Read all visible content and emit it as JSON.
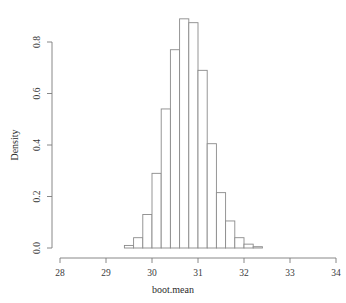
{
  "chart_data": {
    "type": "bar",
    "subtype": "histogram",
    "title": "",
    "xlabel": "boot.mean",
    "ylabel": "Density",
    "xlim": [
      28,
      34
    ],
    "ylim": [
      0,
      0.9
    ],
    "grid": false,
    "legend": null,
    "bin_width": 0.2,
    "bin_edges": [
      29.4,
      29.6,
      29.8,
      30.0,
      30.2,
      30.4,
      30.6,
      30.8,
      31.0,
      31.2,
      31.4,
      31.6,
      31.8,
      32.0,
      32.2,
      32.4
    ],
    "categories": [
      "29.4-29.6",
      "29.6-29.8",
      "29.8-30.0",
      "30.0-30.2",
      "30.2-30.4",
      "30.4-30.6",
      "30.6-30.8",
      "30.8-31.0",
      "31.0-31.2",
      "31.2-31.4",
      "31.4-31.6",
      "31.6-31.8",
      "31.8-32.0",
      "32.0-32.2",
      "32.2-32.4"
    ],
    "values": [
      0.01,
      0.04,
      0.13,
      0.29,
      0.54,
      0.77,
      0.89,
      0.875,
      0.69,
      0.405,
      0.215,
      0.105,
      0.04,
      0.015,
      0.005
    ],
    "xticks": [
      28,
      29,
      30,
      31,
      32,
      33,
      34
    ],
    "xticklabels": [
      "28",
      "29",
      "30",
      "31",
      "32",
      "33",
      "34"
    ],
    "yticks": [
      0.0,
      0.2,
      0.4,
      0.6,
      0.8
    ],
    "yticklabels": [
      "0.0",
      "0.2",
      "0.4",
      "0.6",
      "0.8"
    ],
    "bar_fill": "#ffffff",
    "bar_stroke": "#8a8a8a",
    "axis_color": "#7a7a7a"
  }
}
